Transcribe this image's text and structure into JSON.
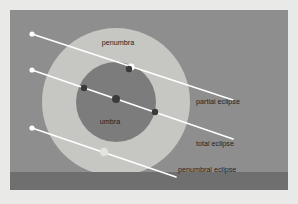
{
  "colors": {
    "page_background": "#e9e9e7",
    "panel_background": "#8e8e8e",
    "ground_band": "#6f6f6f",
    "penumbra_fill": "#c6c6c2",
    "umbra_fill": "#7c7c7c",
    "path_line": "#ffffff",
    "moon_bright": "#ffffff",
    "moon_dim": "#e2e2de",
    "moon_dark": "#3a3a3a",
    "label_text": "#242424"
  },
  "panel": {
    "x": 10,
    "y": 10,
    "width": 278,
    "height": 180,
    "ground_band_y": 172,
    "ground_band_height": 18
  },
  "shadow": {
    "center_x": 116,
    "center_y": 102,
    "penumbra": {
      "label": "penumbra",
      "radius": 74,
      "label_x": 118,
      "label_y": 45
    },
    "umbra": {
      "label": "umbra",
      "radius": 40,
      "label_x": 110,
      "label_y": 124
    }
  },
  "paths": [
    {
      "id": "partial",
      "label": "partial eclipse",
      "label_x": 196,
      "label_y": 104,
      "start": {
        "x": 32,
        "y": 34
      },
      "end": {
        "x": 233,
        "y": 100
      },
      "start_dot": {
        "x": 32,
        "y": 34,
        "r": 2.6,
        "style": "moon_bright"
      },
      "moons": [
        {
          "x": 131,
          "y": 67,
          "r": 3.6,
          "style": "moon_bright"
        },
        {
          "x": 129,
          "y": 69,
          "r": 3.2,
          "style": "moon_dark"
        }
      ]
    },
    {
      "id": "total",
      "label": "total eclipse",
      "label_x": 196,
      "label_y": 146,
      "start": {
        "x": 32,
        "y": 70
      },
      "end": {
        "x": 233,
        "y": 139
      },
      "start_dot": {
        "x": 32,
        "y": 70,
        "r": 2.6,
        "style": "moon_bright"
      },
      "moons": [
        {
          "x": 84,
          "y": 88,
          "r": 3.2,
          "style": "moon_dark"
        },
        {
          "x": 116,
          "y": 99,
          "r": 4.0,
          "style": "moon_dark"
        },
        {
          "x": 155,
          "y": 112,
          "r": 3.2,
          "style": "moon_dark"
        }
      ]
    },
    {
      "id": "penumbral",
      "label": "penumbral eclipse",
      "label_x": 178,
      "label_y": 172,
      "start": {
        "x": 32,
        "y": 128
      },
      "end": {
        "x": 176,
        "y": 177
      },
      "start_dot": {
        "x": 32,
        "y": 128,
        "r": 2.6,
        "style": "moon_bright"
      },
      "moons": [
        {
          "x": 104,
          "y": 152,
          "r": 4.2,
          "style": "moon_dim"
        }
      ]
    }
  ],
  "labels": {
    "penumbra": "penumbra",
    "umbra": "umbra",
    "partial_eclipse": "partial eclipse",
    "total_eclipse": "total eclipse",
    "penumbral_eclipse": "penumbral eclipse"
  }
}
